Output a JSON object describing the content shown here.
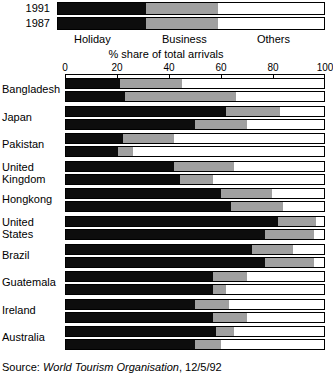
{
  "chart_data": {
    "type": "bar",
    "orientation": "horizontal",
    "stacked": true,
    "title": "",
    "xlabel": "% share of total arrivals",
    "ylabel": "",
    "xlim": [
      0,
      100
    ],
    "xticks": [
      0,
      20,
      40,
      60,
      80,
      100
    ],
    "xtick_labels": [
      "0",
      "20",
      "40",
      "60",
      "80",
      "100"
    ],
    "grid": false,
    "legend_position": "top",
    "series": [
      {
        "name": "Holiday",
        "color": "#0d0d0d"
      },
      {
        "name": "Business",
        "color": "#a0a0a0"
      },
      {
        "name": "Others",
        "color": "#ffffff"
      }
    ],
    "group_keys": [
      "1991",
      "1987"
    ],
    "categories": [
      "Bangladesh",
      "Japan",
      "Pakistan",
      "United\nKingdom",
      "Hongkong",
      "United\nStates",
      "Brazil",
      "Guatemala",
      "Ireland",
      "Australia"
    ],
    "data": [
      {
        "category": "Bangladesh",
        "1991": {
          "Holiday": 21,
          "Business": 24,
          "Others": 55
        },
        "1987": {
          "Holiday": 23,
          "Business": 43,
          "Others": 34
        }
      },
      {
        "category": "Japan",
        "1991": {
          "Holiday": 62,
          "Business": 21,
          "Others": 17
        },
        "1987": {
          "Holiday": 50,
          "Business": 20,
          "Others": 30
        }
      },
      {
        "category": "Pakistan",
        "1991": {
          "Holiday": 22,
          "Business": 20,
          "Others": 58
        },
        "1987": {
          "Holiday": 20,
          "Business": 6,
          "Others": 74
        }
      },
      {
        "category": "United Kingdom",
        "1991": {
          "Holiday": 42,
          "Business": 23,
          "Others": 35
        },
        "1987": {
          "Holiday": 44,
          "Business": 13,
          "Others": 43
        }
      },
      {
        "category": "Hongkong",
        "1991": {
          "Holiday": 60,
          "Business": 20,
          "Others": 20
        },
        "1987": {
          "Holiday": 64,
          "Business": 20,
          "Others": 16
        }
      },
      {
        "category": "United States",
        "1991": {
          "Holiday": 82,
          "Business": 15,
          "Others": 3
        },
        "1987": {
          "Holiday": 77,
          "Business": 19,
          "Others": 4
        }
      },
      {
        "category": "Brazil",
        "1991": {
          "Holiday": 72,
          "Business": 16,
          "Others": 12
        },
        "1987": {
          "Holiday": 77,
          "Business": 19,
          "Others": 4
        }
      },
      {
        "category": "Guatemala",
        "1991": {
          "Holiday": 57,
          "Business": 13,
          "Others": 30
        },
        "1987": {
          "Holiday": 57,
          "Business": 5,
          "Others": 38
        }
      },
      {
        "category": "Ireland",
        "1991": {
          "Holiday": 50,
          "Business": 13,
          "Others": 37
        },
        "1987": {
          "Holiday": 57,
          "Business": 13,
          "Others": 30
        }
      },
      {
        "category": "Australia",
        "1991": {
          "Holiday": 58,
          "Business": 7,
          "Others": 35
        },
        "1987": {
          "Holiday": 50,
          "Business": 10,
          "Others": 40
        }
      }
    ]
  },
  "legend": {
    "year_top": "1991",
    "year_bottom": "1987",
    "sample_split_top": [
      33,
      27,
      40
    ],
    "sample_split_bottom": [
      33,
      27,
      40
    ],
    "labels": {
      "holiday": "Holiday",
      "business": "Business",
      "others": "Others"
    }
  },
  "axis": {
    "title": "% share of total arrivals"
  },
  "source": {
    "prefix": "Source:",
    "organisation": "World Tourism Organisation",
    "date": ", 12/5/92"
  }
}
